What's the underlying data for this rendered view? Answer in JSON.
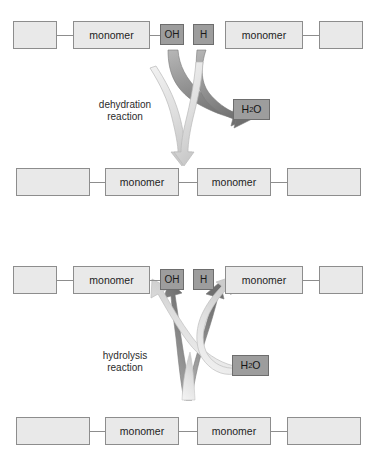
{
  "figure": {
    "background_color": "#ffffff",
    "box_fill": "#e9e9e9",
    "box_border": "#8d8d8d",
    "group_fill": "#9d9d9d",
    "dark_arrow_color": "#8a8a8a",
    "light_arrow_color": "#dcdcdc"
  },
  "dehydration": {
    "caption_line1": "dehydration",
    "caption_line2": "reaction",
    "reactants": {
      "blank_left": "",
      "monomer_left": "monomer",
      "group_oh": "OH",
      "group_h": "H",
      "monomer_right": "monomer",
      "blank_right": ""
    },
    "product_water": {
      "formula_pre": "H",
      "formula_sub": "2",
      "formula_post": "O"
    },
    "products": {
      "blank_left": "",
      "monomer_left": "monomer",
      "monomer_right": "monomer",
      "blank_right": ""
    }
  },
  "hydrolysis": {
    "caption_line1": "hydrolysis",
    "caption_line2": "reaction",
    "products": {
      "blank_left": "",
      "monomer_left": "monomer",
      "group_oh": "OH",
      "group_h": "H",
      "monomer_right": "monomer",
      "blank_right": ""
    },
    "reactant_water": {
      "formula_pre": "H",
      "formula_sub": "2",
      "formula_post": "O"
    },
    "reactants": {
      "blank_left": "",
      "monomer_left": "monomer",
      "monomer_right": "monomer",
      "blank_right": ""
    }
  }
}
